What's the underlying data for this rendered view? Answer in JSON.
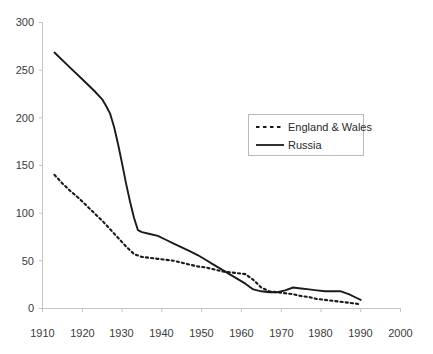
{
  "chart_data": {
    "type": "line",
    "title": "",
    "subtitle": "",
    "xlabel": "",
    "ylabel": "",
    "xlim": [
      1910,
      2000
    ],
    "ylim": [
      0,
      300
    ],
    "grid": false,
    "legend_position": "inside-right",
    "x_ticks": [
      "1910",
      "1920",
      "1930",
      "1940",
      "1950",
      "1960",
      "1970",
      "1980",
      "1990",
      "2000"
    ],
    "y_ticks": [
      "0",
      "50",
      "100",
      "150",
      "200",
      "250",
      "300"
    ],
    "series": [
      {
        "name": "England & Wales",
        "style": "dashed",
        "color": "#1a1a1a",
        "points": [
          [
            1913,
            140
          ],
          [
            1915,
            131
          ],
          [
            1917,
            123
          ],
          [
            1919,
            116
          ],
          [
            1921,
            108
          ],
          [
            1923,
            100
          ],
          [
            1925,
            92
          ],
          [
            1927,
            83
          ],
          [
            1929,
            74
          ],
          [
            1931,
            65
          ],
          [
            1933,
            57
          ],
          [
            1935,
            54
          ],
          [
            1937,
            53
          ],
          [
            1939,
            52
          ],
          [
            1941,
            51
          ],
          [
            1943,
            50
          ],
          [
            1945,
            48
          ],
          [
            1947,
            46
          ],
          [
            1949,
            44
          ],
          [
            1951,
            43
          ],
          [
            1953,
            41
          ],
          [
            1955,
            39
          ],
          [
            1957,
            38
          ],
          [
            1959,
            37
          ],
          [
            1961,
            36
          ],
          [
            1963,
            30
          ],
          [
            1965,
            22
          ],
          [
            1967,
            18
          ],
          [
            1969,
            17
          ],
          [
            1971,
            16
          ],
          [
            1973,
            15
          ],
          [
            1975,
            13
          ],
          [
            1977,
            12
          ],
          [
            1979,
            10
          ],
          [
            1981,
            9
          ],
          [
            1983,
            8
          ],
          [
            1985,
            7
          ],
          [
            1987,
            6
          ],
          [
            1989,
            5
          ],
          [
            1990,
            4
          ]
        ]
      },
      {
        "name": "Russia",
        "style": "solid",
        "color": "#1a1a1a",
        "points": [
          [
            1913,
            268
          ],
          [
            1917,
            252
          ],
          [
            1920,
            240
          ],
          [
            1923,
            228
          ],
          [
            1925,
            219
          ],
          [
            1926,
            212
          ],
          [
            1927,
            204
          ],
          [
            1928,
            190
          ],
          [
            1929,
            172
          ],
          [
            1930,
            152
          ],
          [
            1931,
            131
          ],
          [
            1932,
            112
          ],
          [
            1933,
            95
          ],
          [
            1934,
            82
          ],
          [
            1935,
            80
          ],
          [
            1937,
            78
          ],
          [
            1939,
            76
          ],
          [
            1941,
            72
          ],
          [
            1943,
            68
          ],
          [
            1945,
            64
          ],
          [
            1947,
            60
          ],
          [
            1949,
            56
          ],
          [
            1951,
            51
          ],
          [
            1953,
            46
          ],
          [
            1955,
            41
          ],
          [
            1957,
            36
          ],
          [
            1959,
            31
          ],
          [
            1961,
            26
          ],
          [
            1963,
            20
          ],
          [
            1965,
            18
          ],
          [
            1967,
            17
          ],
          [
            1969,
            17
          ],
          [
            1971,
            19
          ],
          [
            1973,
            22
          ],
          [
            1975,
            21
          ],
          [
            1977,
            20
          ],
          [
            1979,
            19
          ],
          [
            1981,
            18
          ],
          [
            1983,
            18
          ],
          [
            1985,
            18
          ],
          [
            1987,
            15
          ],
          [
            1989,
            11
          ],
          [
            1990,
            9
          ]
        ]
      }
    ],
    "legend": [
      {
        "label": "England & Wales",
        "style": "dashed"
      },
      {
        "label": "Russia",
        "style": "solid"
      }
    ]
  },
  "axis": {
    "y_labels": [
      "300",
      "250",
      "200",
      "150",
      "100",
      "50",
      "0"
    ],
    "x_labels": [
      "1910",
      "1920",
      "1930",
      "1940",
      "1950",
      "1960",
      "1970",
      "1980",
      "1990",
      "2000"
    ]
  },
  "colors": {
    "line": "#1a1a1a",
    "axis": "#c0c0c0",
    "text": "#3a3a3a",
    "legend_border": "#b9b9b9",
    "background": "#ffffff"
  }
}
